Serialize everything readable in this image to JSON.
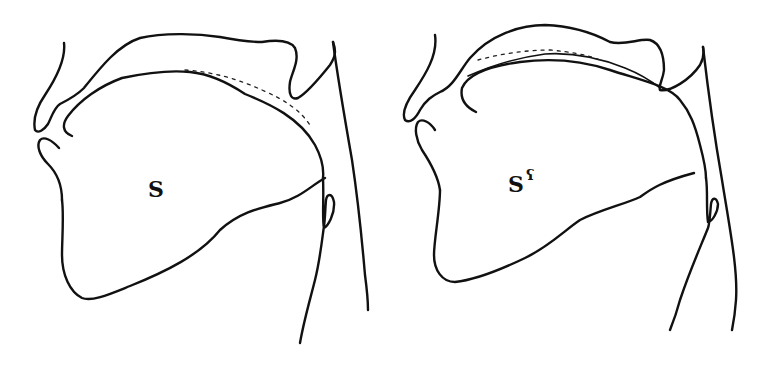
{
  "figure": {
    "colors": {
      "line": "#111111",
      "background": "#ffffff"
    },
    "panels": [
      {
        "id": "left",
        "label_base": "S",
        "label_superscript": ""
      },
      {
        "id": "right",
        "label_base": "S",
        "label_superscript": "ʕ"
      }
    ]
  }
}
